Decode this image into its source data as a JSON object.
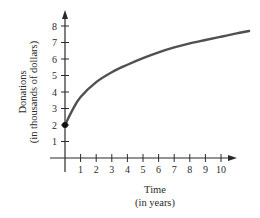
{
  "chart_data": {
    "type": "line",
    "title": "",
    "xlabel": "Time",
    "xlabel_sub": "(in years)",
    "ylabel": "Donations",
    "ylabel_sub": "(in thousands of dollars)",
    "xlim": [
      0,
      11.8
    ],
    "ylim": [
      0,
      9
    ],
    "x_ticks": [
      1,
      2,
      3,
      4,
      5,
      6,
      7,
      8,
      9,
      10
    ],
    "y_ticks": [
      1,
      2,
      3,
      4,
      5,
      6,
      7,
      8
    ],
    "grid": false,
    "legend": null,
    "series": [
      {
        "name": "Donations",
        "color": "#505050",
        "x": [
          0,
          0.5,
          1,
          2,
          3,
          4,
          5,
          6,
          7,
          8,
          9,
          10,
          11,
          11.8
        ],
        "values": [
          2.0,
          2.95,
          3.7,
          4.6,
          5.2,
          5.65,
          6.05,
          6.4,
          6.7,
          6.95,
          7.15,
          7.35,
          7.55,
          7.7
        ]
      }
    ],
    "annotations": [
      {
        "type": "point",
        "x": 0,
        "y": 2,
        "label": ""
      }
    ]
  }
}
